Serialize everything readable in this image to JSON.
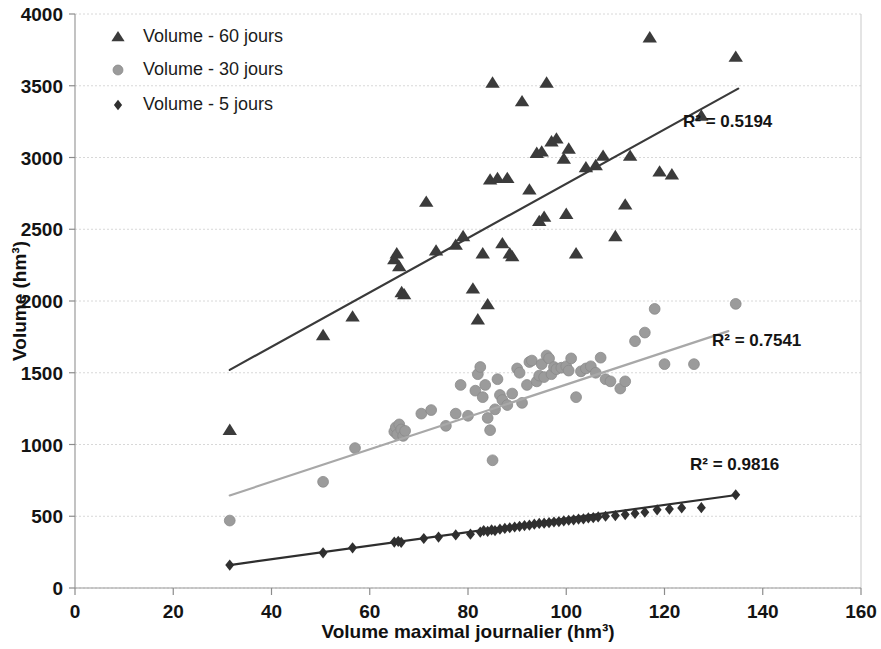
{
  "chart_data": {
    "type": "scatter",
    "title": "",
    "xlabel": "Volume maximal journalier (hm³)",
    "ylabel": "Volume (hm³)",
    "xlim": [
      0,
      160
    ],
    "ylim": [
      0,
      4000
    ],
    "xticks": [
      0,
      20,
      40,
      60,
      80,
      100,
      120,
      140,
      160
    ],
    "yticks": [
      0,
      500,
      1000,
      1500,
      2000,
      2500,
      3000,
      3500,
      4000
    ],
    "grid": "horizontal-dotted",
    "legend_position": "top-left",
    "series": [
      {
        "name": "Volume - 60 jours",
        "marker": "triangle",
        "color": "#3b3b3b",
        "r_squared_label": "R² = 0.5194",
        "r_squared": 0.5194,
        "trendline": {
          "x1": 31.5,
          "y1": 1520,
          "x2": 135.0,
          "y2": 3480,
          "color": "#3a3a3a"
        },
        "points": [
          [
            31.5,
            1100
          ],
          [
            50.5,
            1760
          ],
          [
            56.5,
            1890
          ],
          [
            65.0,
            2290
          ],
          [
            65.5,
            2330
          ],
          [
            66.0,
            2240
          ],
          [
            66.5,
            2060
          ],
          [
            67.0,
            2045
          ],
          [
            71.5,
            2690
          ],
          [
            73.5,
            2350
          ],
          [
            77.5,
            2390
          ],
          [
            79.0,
            2450
          ],
          [
            81.0,
            2085
          ],
          [
            82.0,
            1870
          ],
          [
            83.0,
            2330
          ],
          [
            84.0,
            1975
          ],
          [
            84.5,
            2845
          ],
          [
            85.0,
            3520
          ],
          [
            86.0,
            2855
          ],
          [
            87.0,
            2400
          ],
          [
            88.0,
            2855
          ],
          [
            88.5,
            2330
          ],
          [
            89.0,
            2310
          ],
          [
            91.0,
            3390
          ],
          [
            92.5,
            2775
          ],
          [
            94.0,
            3030
          ],
          [
            94.5,
            2555
          ],
          [
            95.0,
            3040
          ],
          [
            95.5,
            2585
          ],
          [
            96.0,
            3520
          ],
          [
            97.0,
            3110
          ],
          [
            98.0,
            3130
          ],
          [
            99.5,
            2990
          ],
          [
            100.0,
            2605
          ],
          [
            100.5,
            3060
          ],
          [
            102.0,
            2330
          ],
          [
            104.0,
            2930
          ],
          [
            106.0,
            2945
          ],
          [
            107.5,
            3010
          ],
          [
            110.0,
            2450
          ],
          [
            112.0,
            2670
          ],
          [
            113.0,
            3010
          ],
          [
            117.0,
            3835
          ],
          [
            119.0,
            2900
          ],
          [
            121.5,
            2880
          ],
          [
            127.5,
            3290
          ],
          [
            134.5,
            3700
          ]
        ]
      },
      {
        "name": "Volume - 30 jours",
        "marker": "circle",
        "color": "#9b9b9b",
        "r_squared_label": "R² = 0.7541",
        "r_squared": 0.7541,
        "trendline": {
          "x1": 31.5,
          "y1": 645,
          "x2": 133.0,
          "y2": 1790,
          "color": "#a8a8a8"
        },
        "points": [
          [
            31.5,
            470
          ],
          [
            50.5,
            740
          ],
          [
            57.0,
            975
          ],
          [
            65.0,
            1090
          ],
          [
            65.3,
            1120
          ],
          [
            65.6,
            1070
          ],
          [
            66.0,
            1140
          ],
          [
            66.4,
            1105
          ],
          [
            66.8,
            1060
          ],
          [
            67.2,
            1095
          ],
          [
            70.5,
            1215
          ],
          [
            72.5,
            1240
          ],
          [
            75.5,
            1130
          ],
          [
            77.5,
            1215
          ],
          [
            78.5,
            1415
          ],
          [
            80.0,
            1200
          ],
          [
            81.5,
            1375
          ],
          [
            82.0,
            1490
          ],
          [
            82.5,
            1540
          ],
          [
            83.0,
            1330
          ],
          [
            83.5,
            1415
          ],
          [
            84.0,
            1185
          ],
          [
            84.5,
            1100
          ],
          [
            85.0,
            890
          ],
          [
            85.5,
            1245
          ],
          [
            86.0,
            1455
          ],
          [
            86.5,
            1345
          ],
          [
            87.0,
            1310
          ],
          [
            88.0,
            1275
          ],
          [
            89.0,
            1355
          ],
          [
            90.0,
            1530
          ],
          [
            90.5,
            1500
          ],
          [
            91.0,
            1290
          ],
          [
            92.0,
            1415
          ],
          [
            92.5,
            1575
          ],
          [
            93.0,
            1585
          ],
          [
            94.0,
            1440
          ],
          [
            94.5,
            1480
          ],
          [
            95.0,
            1560
          ],
          [
            95.5,
            1470
          ],
          [
            96.0,
            1620
          ],
          [
            96.5,
            1600
          ],
          [
            97.0,
            1490
          ],
          [
            97.5,
            1540
          ],
          [
            98.0,
            1525
          ],
          [
            99.0,
            1535
          ],
          [
            100.0,
            1545
          ],
          [
            100.5,
            1515
          ],
          [
            101.0,
            1600
          ],
          [
            102.0,
            1330
          ],
          [
            103.0,
            1510
          ],
          [
            104.0,
            1530
          ],
          [
            105.0,
            1545
          ],
          [
            106.0,
            1500
          ],
          [
            107.0,
            1605
          ],
          [
            108.0,
            1455
          ],
          [
            109.0,
            1440
          ],
          [
            111.0,
            1390
          ],
          [
            112.0,
            1440
          ],
          [
            114.0,
            1720
          ],
          [
            116.0,
            1780
          ],
          [
            118.0,
            1945
          ],
          [
            120.0,
            1560
          ],
          [
            126.0,
            1560
          ],
          [
            134.5,
            1980
          ]
        ]
      },
      {
        "name": "Volume - 5 jours",
        "marker": "diamond",
        "color": "#303030",
        "r_squared_label": "R² = 0.9816",
        "r_squared": 0.9816,
        "trendline": {
          "x1": 31.5,
          "y1": 160,
          "x2": 135.0,
          "y2": 650,
          "color": "#2e2e2e"
        },
        "points": [
          [
            31.5,
            160
          ],
          [
            50.5,
            245
          ],
          [
            56.5,
            280
          ],
          [
            65.0,
            320
          ],
          [
            65.8,
            325
          ],
          [
            66.4,
            318
          ],
          [
            71.0,
            345
          ],
          [
            74.0,
            355
          ],
          [
            77.5,
            370
          ],
          [
            80.5,
            375
          ],
          [
            82.5,
            390
          ],
          [
            83.2,
            400
          ],
          [
            84.0,
            395
          ],
          [
            84.8,
            405
          ],
          [
            85.5,
            400
          ],
          [
            86.5,
            410
          ],
          [
            87.5,
            415
          ],
          [
            88.5,
            420
          ],
          [
            89.5,
            425
          ],
          [
            90.5,
            430
          ],
          [
            91.5,
            435
          ],
          [
            92.5,
            438
          ],
          [
            93.5,
            445
          ],
          [
            94.5,
            450
          ],
          [
            95.5,
            452
          ],
          [
            96.5,
            455
          ],
          [
            97.5,
            460
          ],
          [
            98.5,
            462
          ],
          [
            99.5,
            468
          ],
          [
            100.5,
            472
          ],
          [
            101.5,
            475
          ],
          [
            102.5,
            480
          ],
          [
            103.5,
            482
          ],
          [
            104.5,
            488
          ],
          [
            105.5,
            490
          ],
          [
            106.5,
            495
          ],
          [
            108.0,
            500
          ],
          [
            110.0,
            505
          ],
          [
            112.0,
            512
          ],
          [
            114.0,
            520
          ],
          [
            116.0,
            528
          ],
          [
            118.5,
            545
          ],
          [
            121.0,
            550
          ],
          [
            123.5,
            558
          ],
          [
            127.5,
            560
          ],
          [
            134.5,
            650
          ]
        ]
      }
    ]
  },
  "legend": {
    "items": [
      {
        "label": "Volume - 60 jours"
      },
      {
        "label": "Volume - 30 jours"
      },
      {
        "label": "Volume - 5 jours"
      }
    ]
  },
  "annotations": [
    {
      "text": "R² = 0.5194"
    },
    {
      "text": "R² = 0.7541"
    },
    {
      "text": "R² = 0.9816"
    }
  ]
}
